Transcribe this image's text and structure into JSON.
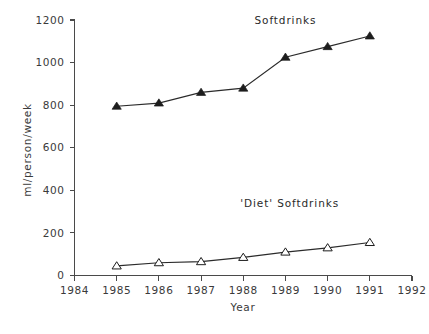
{
  "chart_data": {
    "type": "line",
    "title": "",
    "xlabel": "Year",
    "ylabel": "ml/person/week",
    "x": [
      1985,
      1986,
      1987,
      1988,
      1989,
      1990,
      1991
    ],
    "xlim": [
      1984,
      1992
    ],
    "ylim": [
      0,
      1200
    ],
    "grid": false,
    "legend_position": "inline-annotation",
    "x_ticks": [
      "1984",
      "1985",
      "1986",
      "1987",
      "1988",
      "1989",
      "1990",
      "1991",
      "1992"
    ],
    "x_tick_values": [
      1984,
      1985,
      1986,
      1987,
      1988,
      1989,
      1990,
      1991,
      1992
    ],
    "y_ticks": [
      "0",
      "200",
      "400",
      "600",
      "800",
      "1000",
      "1200"
    ],
    "y_tick_values": [
      0,
      200,
      400,
      600,
      800,
      1000,
      1200
    ],
    "series": [
      {
        "name": "Softdrinks",
        "marker": "triangle-filled",
        "color": "#1d1d1d",
        "values": [
          795,
          810,
          860,
          880,
          1025,
          1075,
          1125
        ],
        "label_x": 1989,
        "label_y": 1180
      },
      {
        "name": "'Diet' Softdrinks",
        "marker": "triangle-open",
        "color": "#1d1d1d",
        "values": [
          45,
          60,
          65,
          85,
          110,
          130,
          155
        ],
        "label_x": 1989.1,
        "label_y": 320
      }
    ]
  },
  "axes": {
    "y_title": "ml/person/week",
    "x_title": "Year"
  },
  "annotations": {
    "softdrinks_label": "Softdrinks",
    "diet_softdrinks_label": "'Diet' Softdrinks"
  }
}
